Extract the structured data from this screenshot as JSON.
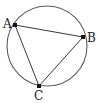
{
  "figure": {
    "type": "inscribed-triangle",
    "circle": {
      "cx": 47,
      "cy": 46,
      "r": 40,
      "stroke": "#5a5a5a",
      "stroke_width": 1.1
    },
    "triangle_stroke": "#3a3a3a",
    "point_color": "#111111",
    "points": [
      {
        "label": "A",
        "x": 15,
        "y": 25,
        "label_x": 3,
        "label_y": 28
      },
      {
        "label": "B",
        "x": 83,
        "y": 37,
        "label_x": 87,
        "label_y": 42
      },
      {
        "label": "C",
        "x": 39,
        "y": 86,
        "label_x": 34,
        "label_y": 100
      }
    ],
    "edges": [
      [
        "A",
        "B"
      ],
      [
        "B",
        "C"
      ],
      [
        "C",
        "A"
      ]
    ]
  }
}
